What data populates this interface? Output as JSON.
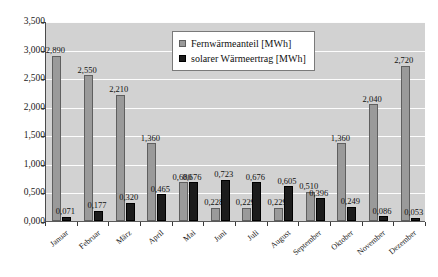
{
  "chart_data": {
    "type": "bar",
    "title": "",
    "xlabel": "",
    "ylabel": "",
    "ylim": [
      0,
      3.5
    ],
    "ytick_labels": [
      "0,000",
      "0,500",
      "1,000",
      "1,500",
      "2,000",
      "2,500",
      "3,000",
      "3,500"
    ],
    "ytick_values": [
      0,
      0.5,
      1.0,
      1.5,
      2.0,
      2.5,
      3.0,
      3.5
    ],
    "grid": true,
    "legend_position": "top-center",
    "categories": [
      "Januar",
      "Februar",
      "März",
      "April",
      "Mai",
      "Juni",
      "Juli",
      "August",
      "September",
      "Oktober",
      "November",
      "Dezember"
    ],
    "series": [
      {
        "name": "Fernwärmeanteil [MWh]",
        "color": "#9a9a9a",
        "values": [
          2.89,
          2.55,
          2.21,
          1.36,
          0.68,
          0.228,
          0.229,
          0.229,
          0.51,
          1.36,
          2.04,
          2.72
        ],
        "labels": [
          "2,890",
          "2,550",
          "2,210",
          "1,360",
          "0,680",
          "0,228",
          "0,229",
          "0,229",
          "0,510",
          "1,360",
          "2,040",
          "2,720"
        ]
      },
      {
        "name": "solarer Wärmeertrag [MWh]",
        "color": "#1c1c1c",
        "values": [
          0.071,
          0.177,
          0.32,
          0.465,
          0.676,
          0.723,
          0.676,
          0.605,
          0.396,
          0.249,
          0.086,
          0.053
        ],
        "labels": [
          "0,071",
          "0,177",
          "0,320",
          "0,465",
          "0,676",
          "0,723",
          "0,676",
          "0,605",
          "0,396",
          "0,249",
          "0,086",
          "0,053"
        ]
      }
    ]
  },
  "legend": {
    "items": [
      {
        "label": "Fernwärmeanteil [MWh]",
        "swatch": "series1-swatch"
      },
      {
        "label": "solarer Wärmeertrag [MWh]",
        "swatch": "series2-swatch"
      }
    ]
  },
  "colors": {
    "series1": "#9a9a9a",
    "series2": "#1c1c1c",
    "plot_background": "#d2d2d2",
    "gridline": "#fdfdfd",
    "axis": "#4a4a4a",
    "text": "#111111",
    "page_background": "#ffffff"
  }
}
